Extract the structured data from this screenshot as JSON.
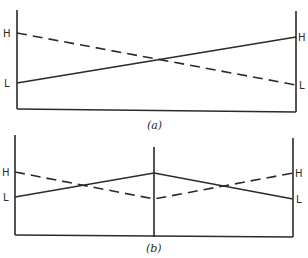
{
  "panels": [
    {
      "caption": "(a)",
      "left_labels": {
        "high": "H",
        "low": "L"
      },
      "right_labels": {
        "high": "H",
        "low": "L"
      },
      "solid_line": "rises from L (left) to H (right)",
      "dashed_line": "falls from H (left) to L (right)"
    },
    {
      "caption": "(b)",
      "left_labels": {
        "high": "H",
        "low": "L"
      },
      "right_labels": {
        "high": "H",
        "low": "L"
      },
      "solid_line": "rises from L (left) to peak at center, falls to L (right)",
      "dashed_line": "falls from H (left) to trough at center, rises to H (right)"
    }
  ],
  "colors": {
    "line": "#2a2a2a",
    "background": "#ffffff"
  }
}
